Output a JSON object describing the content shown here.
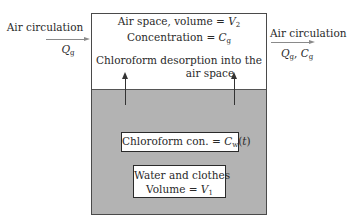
{
  "diagram": {
    "inflow": {
      "label": "Air circulation",
      "var": "Q",
      "var_sub": "g"
    },
    "outflow": {
      "label": "Air circulation",
      "var1": "Q",
      "var1_sub": "g",
      "sep": ", ",
      "var2": "C",
      "var2_sub": "g"
    },
    "air_space": {
      "line1_prefix": "Air space, volume = ",
      "line1_var": "V",
      "line1_sub": "2",
      "line2_prefix": "Concentration = ",
      "line2_var": "C",
      "line2_sub": "g",
      "process_line1": "Chloroform desorption into the",
      "process_line2": "air space"
    },
    "water_zone": {
      "conc_prefix": "Chloroform con. = ",
      "conc_var": "C",
      "conc_sub": "w",
      "conc_suffix_open": "(",
      "conc_arg": "t",
      "conc_suffix_close": ")",
      "volume_line1": "Water and clothes",
      "volume_prefix": "Volume = ",
      "volume_var": "V",
      "volume_sub": "1"
    },
    "colors": {
      "water_fill": "#b3b3b3",
      "border": "#4a4a4a",
      "flow_arrow": "#8a8a8a"
    }
  }
}
